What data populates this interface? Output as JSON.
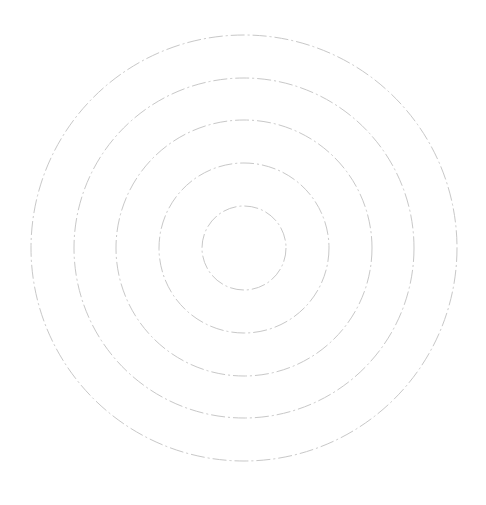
{
  "chart_data": {
    "type": "radar",
    "title": "",
    "series": [],
    "categories": [],
    "grid": {
      "shape": "circle",
      "rings": 5,
      "line_style": "dashed",
      "color": "#cccccc"
    },
    "legend": null
  },
  "layout": {
    "center": [
      244,
      248
    ],
    "radii": [
      42,
      85,
      128,
      170,
      213
    ],
    "stroke_color": "#c8c8c8",
    "background": "#ffffff"
  }
}
